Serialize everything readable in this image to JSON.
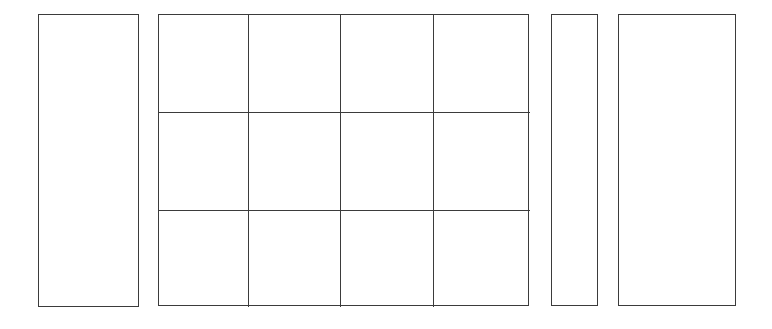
{
  "figure": {
    "background_color": "#ffffff",
    "stroke_color": "#3b3b3b",
    "stroke_width_px": 1.4,
    "fill_color": "#ffffff",
    "canvas": {
      "width": 772,
      "height": 329
    }
  },
  "shapes": [
    {
      "id": "panel-left",
      "label": "",
      "kind": "rectangle",
      "x": 38,
      "y": 14,
      "width": 101,
      "height": 293
    },
    {
      "id": "panel-grid",
      "label": "",
      "kind": "grid",
      "x": 158,
      "y": 14,
      "width": 371,
      "height": 292,
      "columns": 4,
      "rows": 3,
      "column_widths": [
        90,
        92,
        93,
        96
      ],
      "row_heights": [
        98,
        98,
        96
      ],
      "cells": [
        {
          "id": "cell-r1c1",
          "label": ""
        },
        {
          "id": "cell-r1c2",
          "label": ""
        },
        {
          "id": "cell-r1c3",
          "label": ""
        },
        {
          "id": "cell-r1c4",
          "label": ""
        },
        {
          "id": "cell-r2c1",
          "label": ""
        },
        {
          "id": "cell-r2c2",
          "label": ""
        },
        {
          "id": "cell-r2c3",
          "label": ""
        },
        {
          "id": "cell-r2c4",
          "label": ""
        },
        {
          "id": "cell-r3c1",
          "label": ""
        },
        {
          "id": "cell-r3c2",
          "label": ""
        },
        {
          "id": "cell-r3c3",
          "label": ""
        },
        {
          "id": "cell-r3c4",
          "label": ""
        }
      ]
    },
    {
      "id": "panel-narrow",
      "label": "",
      "kind": "rectangle",
      "x": 551,
      "y": 14,
      "width": 47,
      "height": 292
    },
    {
      "id": "panel-right",
      "label": "",
      "kind": "rectangle",
      "x": 618,
      "y": 14,
      "width": 118,
      "height": 292
    }
  ]
}
